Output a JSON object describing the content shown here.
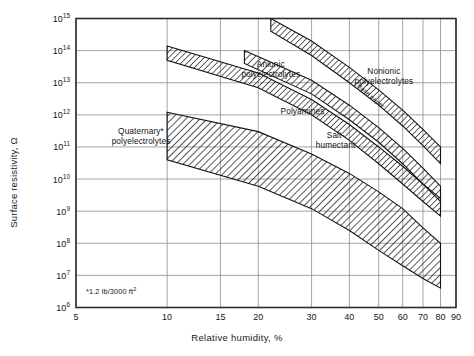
{
  "chart_data": {
    "type": "line",
    "title": "",
    "xlabel": "Relative humidity, %",
    "ylabel": "Surface resistivity, Ω",
    "xscale": "log",
    "yscale": "log",
    "xlim": [
      5,
      90
    ],
    "ylim": [
      1000000.0,
      1000000000000000.0
    ],
    "grid": true,
    "legend_position": "inline-annotations",
    "xticks": [
      5,
      10,
      15,
      20,
      30,
      40,
      50,
      60,
      70,
      80,
      90
    ],
    "xtick_labels": [
      "5",
      "10",
      "15",
      "20",
      "30",
      "40",
      "50",
      "60",
      "70",
      "80",
      "90"
    ],
    "yticks": [
      1000000.0,
      10000000.0,
      100000000.0,
      1000000000.0,
      10000000000.0,
      100000000000.0,
      1000000000000.0,
      10000000000000.0,
      100000000000000.0,
      1000000000000000.0
    ],
    "ytick_labels": [
      "10⁶",
      "10⁷",
      "10⁸",
      "10⁹",
      "10¹⁰",
      "10¹¹",
      "10¹²",
      "10¹³",
      "10¹⁴",
      "10¹⁵"
    ],
    "ytick_mantissa": "10",
    "ytick_exponents": [
      "6",
      "7",
      "8",
      "9",
      "10",
      "11",
      "12",
      "13",
      "14",
      "15"
    ],
    "series": [
      {
        "name": "Quaternary* polyelectrolytes",
        "style": "hatched-band",
        "upper": [
          [
            10,
            1200000000000.0
          ],
          [
            20,
            300000000000.0
          ],
          [
            30,
            60000000000.0
          ],
          [
            40,
            15000000000.0
          ],
          [
            50,
            4000000000.0
          ],
          [
            60,
            1200000000.0
          ],
          [
            70,
            300000000.0
          ],
          [
            80,
            100000000.0
          ]
        ],
        "lower": [
          [
            10,
            40000000000.0
          ],
          [
            20,
            6000000000.0
          ],
          [
            30,
            1200000000.0
          ],
          [
            40,
            250000000.0
          ],
          [
            50,
            60000000.0
          ],
          [
            60,
            20000000.0
          ],
          [
            70,
            8000000.0
          ],
          [
            80,
            4000000.0
          ]
        ]
      },
      {
        "name": "Anionic polyelectrolytes",
        "style": "hatched-band",
        "upper": [
          [
            10,
            140000000000000.0
          ],
          [
            20,
            20000000000000.0
          ],
          [
            30,
            3000000000000.0
          ],
          [
            40,
            500000000000.0
          ],
          [
            50,
            100000000000.0
          ],
          [
            60,
            25000000000.0
          ],
          [
            70,
            7000000000.0
          ],
          [
            80,
            2500000000.0
          ]
        ],
        "lower": [
          [
            10,
            50000000000000.0
          ],
          [
            20,
            7000000000000.0
          ],
          [
            30,
            1000000000000.0
          ],
          [
            40,
            160000000000.0
          ],
          [
            50,
            30000000000.0
          ],
          [
            60,
            7000000000.0
          ],
          [
            70,
            2000000000.0
          ],
          [
            80,
            700000000.0
          ]
        ]
      },
      {
        "name": "Polyamines",
        "style": "hatched-band",
        "upper": [
          [
            18,
            100000000000000.0
          ],
          [
            30,
            12000000000000.0
          ],
          [
            40,
            2000000000000.0
          ],
          [
            50,
            400000000000.0
          ],
          [
            60,
            90000000000.0
          ],
          [
            70,
            22000000000.0
          ],
          [
            80,
            6000000000.0
          ]
        ],
        "lower": [
          [
            18,
            40000000000000.0
          ],
          [
            30,
            4500000000000.0
          ],
          [
            40,
            700000000000.0
          ],
          [
            50,
            140000000000.0
          ],
          [
            60,
            30000000000.0
          ],
          [
            70,
            7000000000.0
          ],
          [
            80,
            2000000000.0
          ]
        ]
      },
      {
        "name": "Salt-humectant / Nonionic polyelectrolytes",
        "style": "hatched-band",
        "upper": [
          [
            22,
            1000000000000000.0
          ],
          [
            30,
            200000000000000.0
          ],
          [
            40,
            30000000000000.0
          ],
          [
            50,
            6000000000000.0
          ],
          [
            60,
            1400000000000.0
          ],
          [
            70,
            350000000000.0
          ],
          [
            80,
            100000000000.0
          ]
        ],
        "lower": [
          [
            22,
            400000000000000.0
          ],
          [
            30,
            70000000000000.0
          ],
          [
            40,
            10000000000000.0
          ],
          [
            50,
            2000000000000.0
          ],
          [
            60,
            450000000000.0
          ],
          [
            70,
            110000000000.0
          ],
          [
            80,
            30000000000.0
          ]
        ]
      }
    ],
    "annotations": [
      {
        "text": "Anionic\npolyelectrolytes",
        "x": 22,
        "y": 25000000000000.0
      },
      {
        "text": "Polyamines",
        "x": 28,
        "y": 1200000000000.0
      },
      {
        "text": "Salt-\nhumectant",
        "x": 36,
        "y": 150000000000.0
      },
      {
        "text": "Nonionic\npolyelectrolytes",
        "x": 52,
        "y": 15000000000000.0
      },
      {
        "text": "Quaternary*\npolyelectrolytes",
        "x": 8.2,
        "y": 200000000000.0
      },
      {
        "text": "Base  paper",
        "x": 47,
        "y": 4000000000000.0,
        "rotated": true
      }
    ],
    "footnote": {
      "prefix": "*1.2 lb/3000 ft",
      "exponent": "2"
    }
  },
  "axis": {
    "ylabel_text": "Surface resistivity, Ω",
    "xlabel_text": "Relative humidity, %"
  },
  "colors": {
    "background": "#ffffff",
    "frame": "#2b2b2b",
    "grid": "#8d8d8d",
    "hatch": "#1e1e1e",
    "text": "#161616"
  }
}
